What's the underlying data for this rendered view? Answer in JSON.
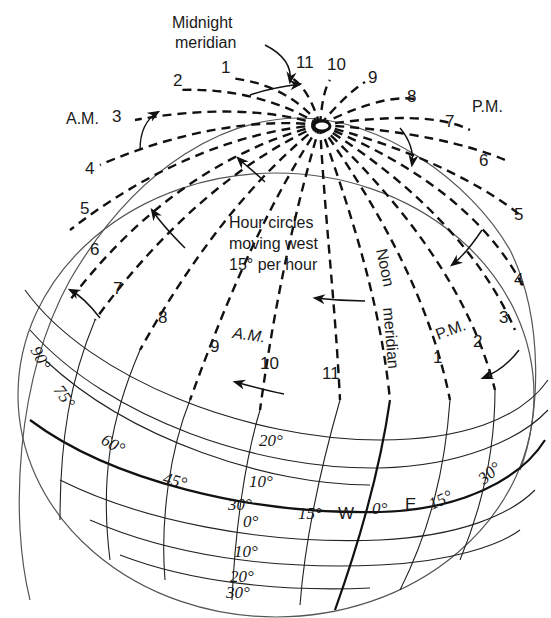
{
  "title_annotations": {
    "midnight_meridian": [
      "Midnight",
      "meridian"
    ],
    "noon_meridian": [
      "Noon",
      "meridian"
    ],
    "caption": [
      "Hour circles",
      "moving west",
      "15° per hour"
    ]
  },
  "period_labels": {
    "am_left": "A.M.",
    "pm_right": "P.M.",
    "am_inner": "A.M.",
    "pm_inner": "P.M."
  },
  "hour_labels_top_am": [
    "1",
    "2",
    "3",
    "4",
    "5",
    "6",
    "7"
  ],
  "hour_labels_top_pm": [
    "11",
    "10",
    "9",
    "8",
    "7",
    "6",
    "5",
    "4"
  ],
  "hour_labels_lower_am": [
    "8",
    "9",
    "10",
    "11"
  ],
  "hour_labels_lower_pm": [
    "1",
    "2",
    "3"
  ],
  "longitude_labels": {
    "west": [
      "90°",
      "75°",
      "60°",
      "45°",
      "30°",
      "15°"
    ],
    "center": "0°",
    "east": [
      "15°",
      "30°"
    ],
    "west_letter": "W",
    "east_letter": "E"
  },
  "latitude_labels": {
    "north": [
      "20°",
      "10°"
    ],
    "equator": "0°",
    "south": [
      "10°",
      "20°",
      "30°"
    ]
  },
  "colors": {
    "ink": "#111111",
    "outline": "#555555",
    "background": "#ffffff"
  }
}
